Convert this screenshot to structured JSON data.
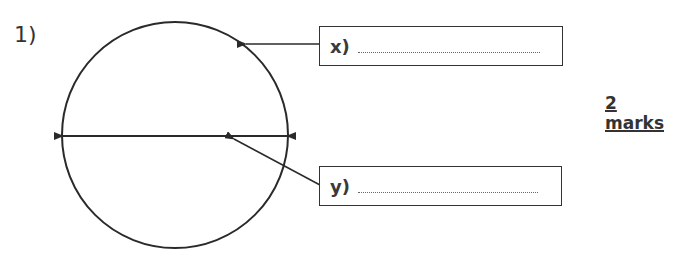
{
  "question": {
    "number": "1)",
    "marks": "2 marks",
    "labels": [
      {
        "id": "x",
        "text": "x)",
        "answer": "",
        "points_to": "circumference"
      },
      {
        "id": "y",
        "text": "y)",
        "answer": "",
        "points_to": "diameter"
      }
    ]
  },
  "colors": {
    "line": "#2a2a2a",
    "background": "#ffffff"
  }
}
